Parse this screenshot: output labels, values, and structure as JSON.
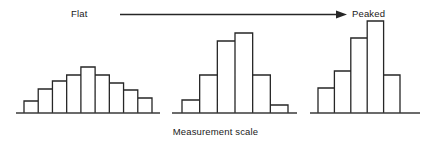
{
  "figure": {
    "left_label": "Flat",
    "right_label": "Peaked",
    "axis_label": "Measurement scale",
    "arrow_direction": "left-to-right",
    "stroke_color": "#262626",
    "baseline_color": "#3a3a3a",
    "background_color": "#ffffff"
  },
  "chart_data": {
    "type": "bar",
    "title": "",
    "subtitle": "",
    "xlabel": "Measurement scale",
    "ylabel": "",
    "grid": false,
    "legend": "none",
    "annotations": [
      {
        "text": "Flat",
        "position": "top-left"
      },
      {
        "text": "Peaked",
        "position": "top-right"
      },
      {
        "text": "Measurement scale",
        "position": "bottom-center"
      },
      {
        "text": "arrow from Flat to Peaked",
        "position": "top-center"
      }
    ],
    "panels": [
      {
        "name": "flat-distribution",
        "categories": [
          "1",
          "2",
          "3",
          "4",
          "5",
          "6",
          "7",
          "8",
          "9"
        ],
        "values": [
          12,
          24,
          32,
          38,
          46,
          38,
          30,
          23,
          15
        ],
        "ylim": [
          0,
          100
        ],
        "baseline_x": [
          16,
          160
        ],
        "bars_x": [
          24,
          152
        ]
      },
      {
        "name": "intermediate-distribution",
        "categories": [
          "1",
          "2",
          "3",
          "4",
          "5",
          "6"
        ],
        "values": [
          13,
          38,
          72,
          80,
          38,
          8
        ],
        "ylim": [
          0,
          100
        ],
        "baseline_x": [
          172,
          297
        ],
        "bars_x": [
          182,
          288
        ]
      },
      {
        "name": "peaked-distribution",
        "categories": [
          "1",
          "2",
          "3",
          "4",
          "5"
        ],
        "values": [
          25,
          42,
          75,
          92,
          38
        ],
        "ylim": [
          0,
          100
        ],
        "baseline_x": [
          310,
          420
        ],
        "bars_x": [
          318,
          400
        ]
      }
    ]
  }
}
